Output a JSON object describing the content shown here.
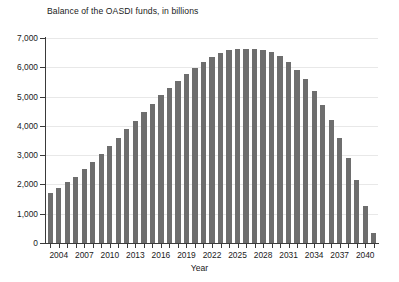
{
  "chart_data": {
    "type": "bar",
    "title": "Balance of the OASDI funds, in billions",
    "xlabel": "Year",
    "ylabel": "",
    "ylim": [
      0,
      7000
    ],
    "ytick_labels": [
      "7,000",
      "6,000",
      "5,000",
      "4,000",
      "3,000",
      "2,000",
      "1,000",
      "0"
    ],
    "ytick_values": [
      7000,
      6000,
      5000,
      4000,
      3000,
      2000,
      1000,
      0
    ],
    "xtick_labels": [
      "2004",
      "2007",
      "2010",
      "2013",
      "2016",
      "2019",
      "2022",
      "2025",
      "2028",
      "2031",
      "2034",
      "2037",
      "2040"
    ],
    "xtick_values": [
      2004,
      2007,
      2010,
      2013,
      2016,
      2019,
      2022,
      2025,
      2028,
      2031,
      2034,
      2037,
      2040
    ],
    "grid": true,
    "legend": "none",
    "bar_color": "#6e6e6e",
    "axis_color": "#3a3a3a",
    "gridline_color": "#e8e8e8",
    "categories": [
      2003,
      2004,
      2005,
      2006,
      2007,
      2008,
      2009,
      2010,
      2011,
      2012,
      2013,
      2014,
      2015,
      2016,
      2017,
      2018,
      2019,
      2020,
      2021,
      2022,
      2023,
      2024,
      2025,
      2026,
      2027,
      2028,
      2029,
      2030,
      2031,
      2032,
      2033,
      2034,
      2035,
      2036,
      2037,
      2038,
      2039,
      2040,
      2041
    ],
    "values": [
      1700,
      1890,
      2070,
      2270,
      2530,
      2770,
      3030,
      3320,
      3570,
      3910,
      4180,
      4480,
      4740,
      5050,
      5280,
      5520,
      5780,
      5980,
      6180,
      6350,
      6500,
      6580,
      6630,
      6630,
      6620,
      6600,
      6510,
      6370,
      6170,
      5920,
      5600,
      5200,
      4720,
      4210,
      3590,
      2910,
      2140,
      1250,
      350
    ]
  }
}
